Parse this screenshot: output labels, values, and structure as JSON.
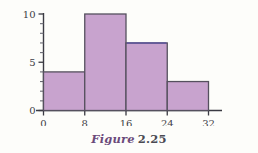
{
  "caption": {
    "word": "Figure",
    "number": "2.25"
  },
  "colors": {
    "bar_fill": "#c8a3ce",
    "bar_edge": "#55505e",
    "bar_edge_highlight": "#4a44a8",
    "axis": "#3a3a42",
    "text": "#3d3d46",
    "caption_word": "#6b4a7a",
    "caption_number": "#4a4a52",
    "background": "#fdfdfa"
  },
  "chart_data": {
    "type": "bar",
    "title": "",
    "subtitle": "",
    "xlabel": "",
    "ylabel": "",
    "categories": [
      "0-8",
      "8-16",
      "16-24",
      "24-32"
    ],
    "bin_edges": [
      0,
      8,
      16,
      24,
      32
    ],
    "values": [
      4,
      10,
      7,
      3
    ],
    "series": [
      {
        "name": "frequency",
        "values": [
          4,
          10,
          7,
          3
        ]
      }
    ],
    "xlim": [
      0,
      32
    ],
    "ylim": [
      0,
      10
    ],
    "xticks": [
      0,
      8,
      16,
      24,
      32
    ],
    "xtick_labels": [
      "0",
      "8",
      "16",
      "24",
      "32"
    ],
    "yticks": [
      0,
      5,
      10
    ],
    "ytick_labels": [
      "0",
      "5",
      "10"
    ],
    "yminor_ticks": [
      1,
      2,
      3,
      4,
      6,
      7,
      8,
      9
    ],
    "grid": false,
    "legend": null,
    "legend_position": "none"
  }
}
